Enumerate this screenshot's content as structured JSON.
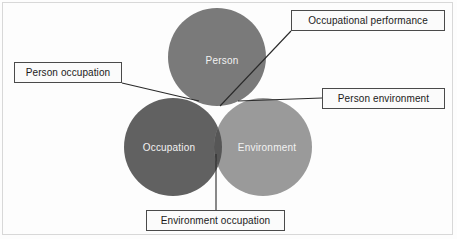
{
  "diagram": {
    "background_color": "#fdfdfd",
    "circles": [
      {
        "id": "person",
        "label": "Person",
        "color": "#7a7a7a",
        "cx": 217,
        "cy": 57,
        "r": 49
      },
      {
        "id": "occupation",
        "label": "Occupation",
        "color": "#616161",
        "cx": 173,
        "cy": 147,
        "r": 49
      },
      {
        "id": "environment",
        "label": "Environment",
        "color": "#9a9a9a",
        "cx": 263,
        "cy": 147,
        "r": 49
      }
    ],
    "intersections": [
      {
        "id": "person-occupation",
        "label": "Person occupation",
        "color": "#4e4e4e"
      },
      {
        "id": "person-environment",
        "label": "Person environment",
        "color": "#5f5f5f"
      },
      {
        "id": "environment-occupation",
        "label": "Environment occupation",
        "color": "#565656"
      },
      {
        "id": "occupational-performance",
        "label": "Occupational performance",
        "color": "#3d3d3d"
      }
    ],
    "callouts": [
      {
        "id": "occupational-performance",
        "text": "Occupational performance",
        "leader_from": [
          291,
          31
        ],
        "leader_to": [
          220,
          106
        ]
      },
      {
        "id": "person-occupation",
        "text": "Person occupation",
        "leader_from": [
          122,
          83
        ],
        "leader_to": [
          199,
          101
        ]
      },
      {
        "id": "person-environment",
        "text": "Person environment",
        "leader_from": [
          322,
          98
        ],
        "leader_to": [
          238,
          101
        ]
      },
      {
        "id": "environment-occupation",
        "text": "Environment occupation",
        "leader_from": [
          216,
          210
        ],
        "leader_to": [
          216,
          154
        ]
      }
    ],
    "line_color": "#2a2a2a",
    "label_text_color": "#f2f2f2"
  }
}
